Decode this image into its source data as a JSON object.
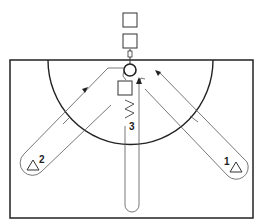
{
  "diagram": {
    "title": "",
    "type": "basketball drill diagram",
    "players": [
      {
        "id": "1",
        "label": "1",
        "shape": "triangle",
        "position": "right corner"
      },
      {
        "id": "2",
        "label": "2",
        "shape": "triangle",
        "position": "left corner"
      },
      {
        "id": "3",
        "label": "3",
        "shape": "none",
        "position": "center lane, dribble zigzag"
      }
    ],
    "squares": [
      {
        "id": "sq-top-1",
        "label": ""
      },
      {
        "id": "sq-top-2",
        "label": ""
      },
      {
        "id": "sq-lane",
        "label": ""
      }
    ],
    "elements": [
      "court-boundary",
      "three-point-arc",
      "hoop",
      "backboard",
      "cut-paths",
      "arrows"
    ],
    "colors": {
      "line": "#222222",
      "path": "#555555",
      "background": "#ffffff"
    }
  }
}
